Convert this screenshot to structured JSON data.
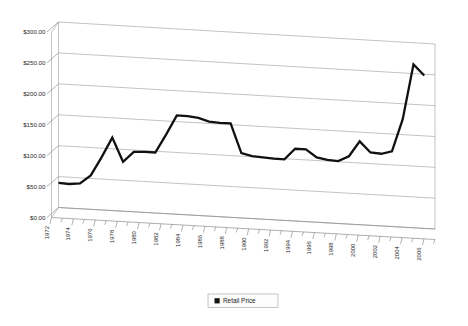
{
  "chart_data": {
    "type": "line",
    "title": "",
    "subtitle": "",
    "xlabel": "",
    "ylabel": "",
    "ylim": [
      0,
      300
    ],
    "xlim": [
      1972,
      2007
    ],
    "grid": true,
    "grid_orientation": "horizontal",
    "projection": "3d-perspective",
    "legend_position": "bottom-center",
    "y_tick_labels": [
      "$300.00",
      "$250.00",
      "$200.00",
      "$150.00",
      "$100.00",
      "$50.00",
      "$0.00"
    ],
    "y_tick_values": [
      300,
      250,
      200,
      150,
      100,
      50,
      0
    ],
    "x_tick_labels": [
      "1972",
      "1974",
      "1976",
      "1978",
      "1980",
      "1982",
      "1984",
      "1986",
      "1988",
      "1990",
      "1992",
      "1994",
      "1996",
      "1998",
      "2000",
      "2002",
      "2004",
      "2006"
    ],
    "x_minor_ticks_every_year": true,
    "legend": [
      {
        "name": "Retail Price",
        "color": "#141414",
        "marker": "square"
      }
    ],
    "series": [
      {
        "name": "Retail Price",
        "color": "#141414",
        "x": [
          1972,
          1973,
          1974,
          1975,
          1976,
          1977,
          1978,
          1979,
          1980,
          1981,
          1982,
          1983,
          1984,
          1985,
          1986,
          1987,
          1988,
          1989,
          1990,
          1991,
          1992,
          1993,
          1994,
          1995,
          1996,
          1997,
          1998,
          1999,
          2000,
          2001,
          2002,
          2003,
          2004,
          2005,
          2006
        ],
        "values": [
          40,
          39,
          41,
          55,
          85,
          118,
          80,
          97,
          98,
          98,
          128,
          160,
          160,
          158,
          153,
          152,
          152,
          105,
          101,
          100,
          99,
          99,
          117,
          117,
          105,
          102,
          101,
          110,
          135,
          118,
          117,
          122,
          175,
          265,
          248
        ]
      }
    ],
    "annotations": []
  },
  "legend_entry": "Retail Price"
}
